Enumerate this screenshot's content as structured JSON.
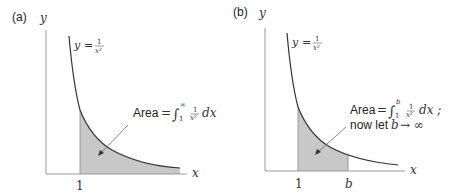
{
  "panels": [
    {
      "label": "(a)",
      "y_axis": "y",
      "x_axis": "x",
      "curve_label_lhs": "y",
      "curve_label_eq": "=",
      "curve_num": "1",
      "curve_den": "x²",
      "tick_1": "1",
      "area_word": "Area",
      "area_eq": "=",
      "integral": "∫",
      "upper": "∞",
      "lower": "1",
      "frac_num": "1",
      "frac_den": "x²",
      "dx": "dx"
    },
    {
      "label": "(b)",
      "y_axis": "y",
      "x_axis": "x",
      "curve_label_lhs": "y",
      "curve_label_eq": "=",
      "curve_num": "1",
      "curve_den": "x²",
      "tick_1": "1",
      "tick_b": "b",
      "area_word": "Area",
      "area_eq": "=",
      "integral": "∫",
      "upper": "b",
      "lower": "1",
      "frac_num": "1",
      "frac_den": "x²",
      "dx": "dx ;",
      "line2_text": "now let",
      "line2_var": "b",
      "line2_arrow": "→ ∞"
    }
  ],
  "colors": {
    "axis": "#999999",
    "curve": "#333333",
    "shade": "#c8c8c8"
  }
}
